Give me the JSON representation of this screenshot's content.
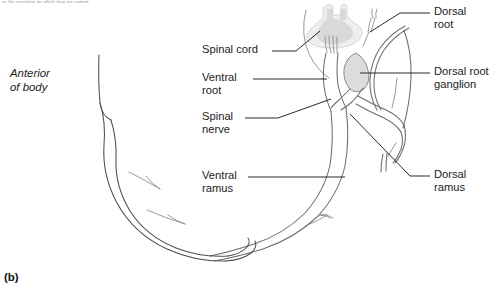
{
  "figure": {
    "panel_letter": "(b)",
    "top_caption": "as the vertebrae for which they are named.",
    "orientation_label": "Anterior\nof body"
  },
  "labels": {
    "spinal_cord": "Spinal cord",
    "ventral_root": "Ventral\nroot",
    "spinal_nerve": "Spinal\nnerve",
    "ventral_ramus": "Ventral\nramus",
    "dorsal_root": "Dorsal\nroot",
    "dorsal_root_ganglion": "Dorsal root\nganglion",
    "dorsal_ramus": "Dorsal\nramus"
  },
  "colors": {
    "gray_matter": "#d9d9d9",
    "cord_fill": "#eeeeee",
    "ganglion_fill": "#dcdcdc",
    "nerve_stroke": "#6d6d6d",
    "body_wall_stroke": "#4f4f4f",
    "leader_line": "#1f1f1f",
    "text": "#1b1b1b",
    "background": "#ffffff"
  }
}
